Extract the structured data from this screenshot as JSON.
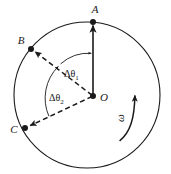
{
  "figure": {
    "background_color": "#ffffff",
    "ink_color": "#1a1a1a",
    "disk": {
      "label": "disk-outline",
      "center_x": 87,
      "center_y": 95,
      "radius": 73
    },
    "points": [
      {
        "id": "A",
        "label": "A",
        "x": 93,
        "y": 22,
        "label_x": 95,
        "label_y": 13,
        "label_anchor": "middle"
      },
      {
        "id": "B",
        "label": "B",
        "x": 31,
        "y": 49,
        "label_x": 21,
        "label_y": 44,
        "label_anchor": "middle"
      },
      {
        "id": "C",
        "label": "C",
        "x": 25,
        "y": 128,
        "label_x": 14,
        "label_y": 133,
        "label_anchor": "middle"
      },
      {
        "id": "O",
        "label": "O",
        "x": 93,
        "y": 96,
        "label_x": 100,
        "label_y": 101,
        "label_anchor": "start"
      }
    ],
    "radii": [
      {
        "id": "OA",
        "style": "solid",
        "from": "O",
        "to": "A",
        "arrowhead": "at-rim"
      },
      {
        "id": "OB",
        "style": "dashed",
        "from": "O",
        "to": "B",
        "arrowhead": "at-rim"
      },
      {
        "id": "OC",
        "style": "dashed",
        "from": "O",
        "to": "C",
        "arrowhead": "at-rim"
      }
    ],
    "angles": [
      {
        "id": "delta-theta-1",
        "symbol": "Δθ",
        "subscript": "1",
        "between": [
          "OB",
          "OA"
        ],
        "label_x": 64,
        "label_y": 77,
        "arc_radius": 42,
        "arrowhead": "at-OA-end"
      },
      {
        "id": "delta-theta-2",
        "symbol": "Δθ",
        "subscript": "2",
        "between": [
          "OC",
          "OB"
        ],
        "label_x": 49,
        "label_y": 101,
        "arc_radius": 45,
        "arrowhead": "at-OB-end"
      }
    ],
    "rotation": {
      "id": "angular-velocity",
      "symbol": "ω",
      "label_x": 124,
      "label_y": 118,
      "label_rotation_deg": -90,
      "direction": "counterclockwise",
      "arrow_arc": "inside-right-rim-pointing-up"
    }
  }
}
